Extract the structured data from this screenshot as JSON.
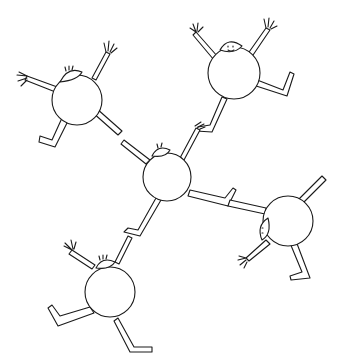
{
  "illustration": {
    "subject": "five round cartoon figures linked hand-to-foot in a cross formation",
    "style": "black line drawing on white",
    "colors": {
      "background": "#ffffff",
      "ink": "#1a1a1a"
    },
    "figures": [
      {
        "id": "top-left",
        "pose": "arms raised, legs kicking"
      },
      {
        "id": "top-right",
        "pose": "arms raised, leg kicking right"
      },
      {
        "id": "center",
        "pose": "holding hands with all four neighbours"
      },
      {
        "id": "right",
        "pose": "sideways, head facing left"
      },
      {
        "id": "bottom-left",
        "pose": "arms up, sitting legs out"
      }
    ]
  }
}
